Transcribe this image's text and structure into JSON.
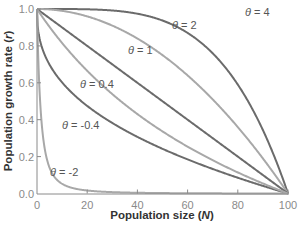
{
  "chart_data": {
    "type": "line",
    "title": "",
    "xlabel": "Population size",
    "xlabel_var": "N",
    "ylabel": "Population growth rate",
    "ylabel_var": "r",
    "xlim": [
      0,
      100
    ],
    "ylim": [
      0.0,
      1.0
    ],
    "x_ticks": [
      "0",
      "20",
      "40",
      "60",
      "80",
      "100"
    ],
    "y_ticks": [
      "0.0",
      "0.2",
      "0.4",
      "0.6",
      "0.8",
      "1.0"
    ],
    "grid": false,
    "legend": "inline labels",
    "formula": "r = 1 - (N/K)^theta, K = 100",
    "series": [
      {
        "name": "θ = 4",
        "theta": 4,
        "color": "#6b6b6b",
        "label_pos": [
          245,
          12
        ],
        "x": [
          0,
          20,
          40,
          60,
          80,
          90,
          100
        ],
        "values": [
          1.0,
          0.998,
          0.974,
          0.87,
          0.59,
          0.344,
          0.0
        ]
      },
      {
        "name": "θ = 2",
        "theta": 2,
        "color": "#a8a8a8",
        "label_pos": [
          172,
          25
        ],
        "x": [
          0,
          20,
          40,
          60,
          80,
          90,
          100
        ],
        "values": [
          1.0,
          0.96,
          0.84,
          0.64,
          0.36,
          0.19,
          0.0
        ]
      },
      {
        "name": "θ = 1",
        "theta": 1,
        "color": "#6b6b6b",
        "label_pos": [
          128,
          50
        ],
        "x": [
          0,
          20,
          40,
          60,
          80,
          100
        ],
        "values": [
          1.0,
          0.8,
          0.6,
          0.4,
          0.2,
          0.0
        ]
      },
      {
        "name": "θ = 0.4",
        "theta": 0.4,
        "color": "#6b6b6b",
        "label_pos": [
          80,
          84
        ],
        "x": [
          0,
          5,
          20,
          40,
          60,
          80,
          100
        ],
        "values": [
          1.0,
          0.698,
          0.475,
          0.307,
          0.185,
          0.085,
          0.0
        ]
      },
      {
        "name": "θ = -0.4",
        "theta": -0.4,
        "color": "#a8a8a8",
        "label_pos": [
          62,
          125
        ],
        "x": [
          2,
          5,
          20,
          40,
          60,
          80,
          100
        ],
        "values": [
          0.79,
          0.67,
          0.45,
          0.3,
          0.18,
          0.08,
          0.0
        ]
      },
      {
        "name": "θ = -2",
        "theta": -2,
        "color": "#a8a8a8",
        "label_pos": [
          50,
          172
        ],
        "x": [
          0,
          1.5,
          3,
          5,
          10,
          20,
          100
        ],
        "values": [
          1.0,
          0.9,
          0.2,
          0.05,
          0.02,
          0.01,
          0.0
        ]
      }
    ]
  }
}
